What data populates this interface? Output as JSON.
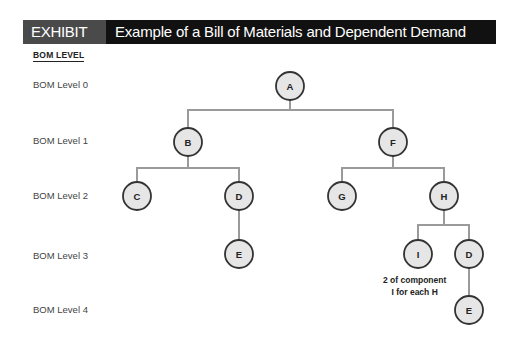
{
  "header": {
    "exhibit_label": "EXHIBIT 13.8",
    "title": "Example of a Bill of Materials and Dependent Demand"
  },
  "axis_title": "BOM LEVEL",
  "levels": [
    {
      "label": "BOM Level 0",
      "y": 85
    },
    {
      "label": "BOM Level 1",
      "y": 141
    },
    {
      "label": "BOM Level 2",
      "y": 196
    },
    {
      "label": "BOM Level 3",
      "y": 256
    },
    {
      "label": "BOM Level 4",
      "y": 310
    }
  ],
  "nodes": [
    {
      "id": "A",
      "label": "A",
      "level": 0,
      "x": 290,
      "y": 86
    },
    {
      "id": "B",
      "label": "B",
      "level": 1,
      "x": 188,
      "y": 142
    },
    {
      "id": "F",
      "label": "F",
      "level": 1,
      "x": 393,
      "y": 142
    },
    {
      "id": "C",
      "label": "C",
      "level": 2,
      "x": 137,
      "y": 196
    },
    {
      "id": "D1",
      "label": "D",
      "level": 2,
      "x": 239,
      "y": 196
    },
    {
      "id": "G",
      "label": "G",
      "level": 2,
      "x": 342,
      "y": 196
    },
    {
      "id": "H",
      "label": "H",
      "level": 2,
      "x": 444,
      "y": 196
    },
    {
      "id": "E1",
      "label": "E",
      "level": 3,
      "x": 239,
      "y": 254
    },
    {
      "id": "I",
      "label": "I",
      "level": 3,
      "x": 418,
      "y": 254
    },
    {
      "id": "D2",
      "label": "D",
      "level": 3,
      "x": 469,
      "y": 254
    },
    {
      "id": "E2",
      "label": "E",
      "level": 4,
      "x": 469,
      "y": 310
    }
  ],
  "edges": [
    {
      "parent": "A",
      "children": [
        "B",
        "F"
      ],
      "bar_y": 110
    },
    {
      "parent": "B",
      "children": [
        "C",
        "D1"
      ],
      "bar_y": 168
    },
    {
      "parent": "F",
      "children": [
        "G",
        "H"
      ],
      "bar_y": 168
    },
    {
      "parent": "D1",
      "children": [
        "E1"
      ],
      "bar_y": null
    },
    {
      "parent": "H",
      "children": [
        "I",
        "D2"
      ],
      "bar_y": 225
    },
    {
      "parent": "D2",
      "children": [
        "E2"
      ],
      "bar_y": null
    }
  ],
  "annotation": {
    "line1": "2 of component",
    "line2": "I for each H"
  },
  "colors": {
    "node_fill": "#e6e6e6",
    "node_stroke": "#333333",
    "edge": "#9a9a9a",
    "header_bg": "#111111",
    "header_label_bg": "#4a4a4a"
  }
}
